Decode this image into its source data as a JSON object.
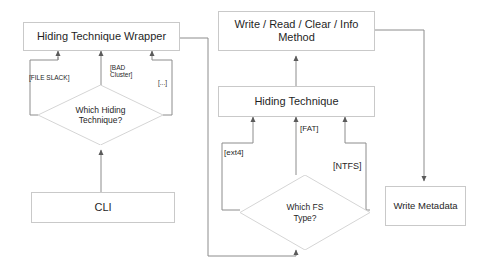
{
  "diagram": {
    "type": "flowchart",
    "colors": {
      "node_border": "#c9c9c9",
      "node_fill": "#ffffff",
      "edge_stroke": "#8c8c8c",
      "text": "#1f1f1f",
      "background": "#ffffff"
    },
    "nodes": [
      {
        "id": "wrapper",
        "shape": "box",
        "label": "Hiding Technique Wrapper"
      },
      {
        "id": "which-hiding",
        "shape": "diamond",
        "label": "Which Hiding\nTechnique?"
      },
      {
        "id": "cli",
        "shape": "box",
        "label": "CLI"
      },
      {
        "id": "method",
        "shape": "box",
        "label": "Write / Read / Clear / Info\nMethod"
      },
      {
        "id": "hiding-tech",
        "shape": "box",
        "label": "Hiding Technique"
      },
      {
        "id": "which-fs",
        "shape": "diamond",
        "label": "Which FS\nType?"
      },
      {
        "id": "write-metadata",
        "shape": "box",
        "label": "Write Metadata"
      }
    ],
    "edge_labels": {
      "file_slack": "[FILE SLACK]",
      "bad_cluster": "[BAD\nCluster]",
      "ellipsis": "[...]",
      "ext4": "[ext4]",
      "fat": "[FAT]",
      "ntfs": "[NTFS]"
    },
    "edges": [
      {
        "from": "cli",
        "to": "which-hiding",
        "label": ""
      },
      {
        "from": "which-hiding",
        "to": "wrapper",
        "label": "[FILE SLACK]"
      },
      {
        "from": "which-hiding",
        "to": "wrapper",
        "label": "[BAD Cluster]"
      },
      {
        "from": "which-hiding",
        "to": "wrapper",
        "label": "[...]"
      },
      {
        "from": "wrapper",
        "to": "which-fs",
        "label": ""
      },
      {
        "from": "which-fs",
        "to": "hiding-tech",
        "label": "[ext4]"
      },
      {
        "from": "which-fs",
        "to": "hiding-tech",
        "label": "[FAT]"
      },
      {
        "from": "which-fs",
        "to": "hiding-tech",
        "label": "[NTFS]"
      },
      {
        "from": "hiding-tech",
        "to": "method",
        "label": ""
      },
      {
        "from": "method",
        "to": "write-metadata",
        "label": ""
      }
    ]
  }
}
